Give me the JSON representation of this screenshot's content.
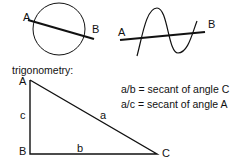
{
  "circle_figure": {
    "label_a": "A",
    "label_b": "B"
  },
  "sine_figure": {
    "label_a": "A",
    "label_b": "B"
  },
  "section_title": "trigonometry:",
  "triangle": {
    "vertex_a": "A",
    "vertex_b": "B",
    "vertex_c": "C",
    "side_a": "a",
    "side_b": "b",
    "side_c": "c"
  },
  "equations": [
    "a/b = secant of angle C",
    "a/c = secant of angle A"
  ]
}
